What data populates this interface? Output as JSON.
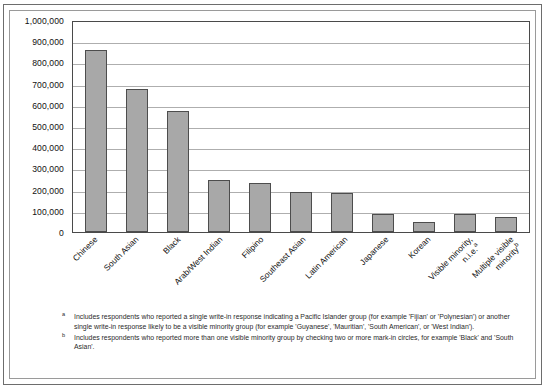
{
  "chart_data": {
    "type": "bar",
    "title": "",
    "xlabel": "",
    "ylabel": "",
    "ylim": [
      0,
      1000000
    ],
    "grid": true,
    "legend": "none",
    "categories": [
      "Chinese",
      "South Asian",
      "Black",
      "Arab/West Indian",
      "Filipino",
      "Southeast Asian",
      "Latin American",
      "Japanese",
      "Korean",
      "Visible minority, n.i.e.",
      "Multiple visible minority"
    ],
    "values": [
      860000,
      675000,
      570000,
      245000,
      230000,
      190000,
      185000,
      85000,
      45000,
      85000,
      70000
    ],
    "tick_labels": [
      "1,000,000",
      "900,000",
      "800,000",
      "700,000",
      "600,000",
      "500,000",
      "400,000",
      "300,000",
      "200,000",
      "100,000",
      "0"
    ],
    "tick_values": [
      1000000,
      900000,
      800000,
      700000,
      600000,
      500000,
      400000,
      300000,
      200000,
      100000,
      0
    ],
    "category_labels": [
      {
        "line1": "Chinese",
        "line2": "",
        "marker": ""
      },
      {
        "line1": "South Asian",
        "line2": "",
        "marker": ""
      },
      {
        "line1": "Black",
        "line2": "",
        "marker": ""
      },
      {
        "line1": "Arab/West Indian",
        "line2": "",
        "marker": ""
      },
      {
        "line1": "Filipino",
        "line2": "",
        "marker": ""
      },
      {
        "line1": "Southeast Asian",
        "line2": "",
        "marker": ""
      },
      {
        "line1": "Latin American",
        "line2": "",
        "marker": ""
      },
      {
        "line1": "Japanese",
        "line2": "",
        "marker": ""
      },
      {
        "line1": "Korean",
        "line2": "",
        "marker": ""
      },
      {
        "line1": "Visible minority,",
        "line2": "n.i.e.",
        "marker": "a"
      },
      {
        "line1": "Multiple visible",
        "line2": "minority",
        "marker": "b"
      }
    ],
    "bar_color": "#a8a8a8",
    "bar_border_color": "#4d4d4d",
    "gridline_color": "#aeaeae",
    "axis_color": "#4a4a4a"
  },
  "footnotes": [
    {
      "marker": "a",
      "text": "Includes respondents who reported a single write-in response indicating a Pacific Islander group (for example 'Fijian' or 'Polynesian') or another single write-in response likely to be a visible minority group (for example 'Guyanese', 'Mauritian', 'South American', or 'West Indian')."
    },
    {
      "marker": "b",
      "text": "Includes respondents who reported more than one visible minority group by checking two or more mark-in circles, for example 'Black' and 'South Asian'."
    }
  ]
}
